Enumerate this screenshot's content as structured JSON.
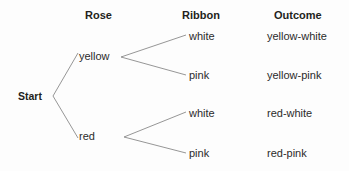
{
  "diagram": {
    "type": "tree",
    "background_color": "#fdfdfd",
    "line_color": "#8a8a8a",
    "text_color": "#2b2b2b",
    "headers": [
      {
        "label": "Rose"
      },
      {
        "label": "Ribbon"
      },
      {
        "label": "Outcome"
      }
    ],
    "root": {
      "label": "Start"
    },
    "stage1": [
      {
        "label": "yellow"
      },
      {
        "label": "red"
      }
    ],
    "stage2": [
      {
        "label": "white"
      },
      {
        "label": "pink"
      },
      {
        "label": "white"
      },
      {
        "label": "pink"
      }
    ],
    "outcomes": [
      {
        "label": "yellow-white"
      },
      {
        "label": "yellow-pink"
      },
      {
        "label": "red-white"
      },
      {
        "label": "red-pink"
      }
    ]
  }
}
